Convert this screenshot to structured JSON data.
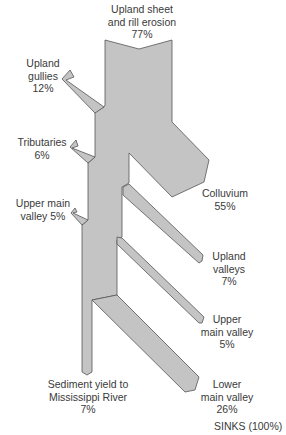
{
  "diagram": {
    "fill_color": "#c4c4c4",
    "stroke_color": "#555555",
    "sources": [
      {
        "id": "upland-sheet",
        "label": "Upland sheet\nand rill erosion\n77%",
        "name": "Upland sheet and rill erosion",
        "percent": 77
      },
      {
        "id": "upland-gullies",
        "label": "Upland\ngullies\n12%",
        "name": "Upland gullies",
        "percent": 12
      },
      {
        "id": "tributaries",
        "label": "Tributaries\n6%",
        "name": "Tributaries",
        "percent": 6
      },
      {
        "id": "upper-main-valley-source",
        "label": "Upper main\nvalley 5%",
        "name": "Upper main valley",
        "percent": 5
      }
    ],
    "sinks": [
      {
        "id": "colluvium",
        "label": "Colluvium\n55%",
        "name": "Colluvium",
        "percent": 55
      },
      {
        "id": "upland-valleys",
        "label": "Upland\nvalleys\n7%",
        "name": "Upland valleys",
        "percent": 7
      },
      {
        "id": "upper-main-valley-sink",
        "label": "Upper\nmain valley\n5%",
        "name": "Upper main valley",
        "percent": 5
      },
      {
        "id": "lower-main-valley",
        "label": "Lower\nmain valley\n26%",
        "name": "Lower main valley",
        "percent": 26
      },
      {
        "id": "sediment-yield",
        "label": "Sediment yield to\nMississippi River\n7%",
        "name": "Sediment yield to Mississippi River",
        "percent": 7
      }
    ],
    "sinks_total_label": "SINKS (100%)"
  }
}
